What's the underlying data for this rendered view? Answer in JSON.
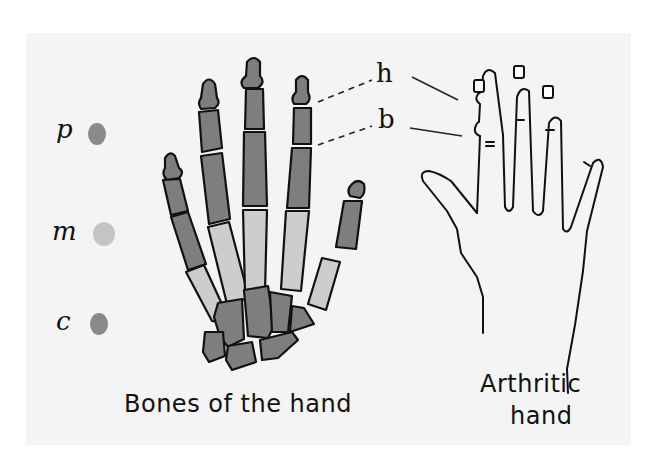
{
  "legend": {
    "items": [
      {
        "letter": "p",
        "meaning_color": "#8a8a8a"
      },
      {
        "letter": "m",
        "meaning_color": "#c4c4c4"
      },
      {
        "letter": "c",
        "meaning_color": "#8a8a8a"
      }
    ]
  },
  "annotations": {
    "h": "h",
    "b": "b"
  },
  "captions": {
    "bones": "Bones of the hand",
    "arthritic_line1": "Arthritic",
    "arthritic_line2": "hand"
  },
  "colors": {
    "background": "#ffffff",
    "paper": "#f4f4f4",
    "dark_bone": "#7e7e7e",
    "light_bone": "#cdcdcd",
    "ink": "#111111"
  }
}
